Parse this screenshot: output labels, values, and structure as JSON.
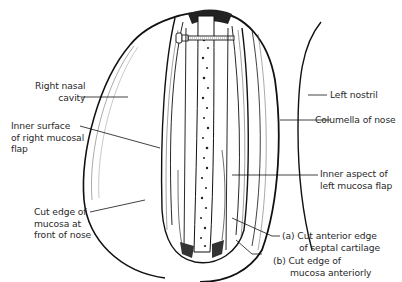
{
  "diagram": {
    "colors": {
      "ink": "#111111",
      "label": "#2a2a2a",
      "background": "#ffffff"
    },
    "labels": {
      "right_nasal_cavity": "Right nasal\ncavity",
      "inner_surface_right_flap": "Inner surface\nof right mucosal\nflap",
      "cut_edge_front": "Cut edge of\nmucosa at\nfront of nose",
      "left_nostril": "Left nostril",
      "columella": "Columella of nose",
      "inner_aspect_left_flap": "Inner aspect of\nleft mucosa flap",
      "cut_anterior_edge": "(a) Cut anterior edge\n      of septal cartilage",
      "cut_edge_mucosa": "(b) Cut edge of\n      mucosa anteriorly"
    }
  }
}
